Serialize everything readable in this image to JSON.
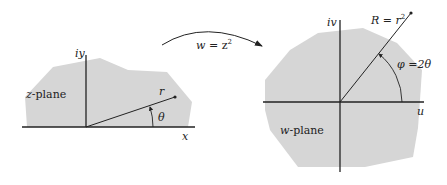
{
  "mapping": {
    "label": "w = z²",
    "label_w": "w",
    "label_eq": " = z",
    "label_exp": "2"
  },
  "z_plane": {
    "name": "z-plane",
    "name_var": "z",
    "name_rest": "-plane",
    "x_axis_label": "x",
    "y_axis_label": "iy",
    "radius_label": "r",
    "angle_label": "θ"
  },
  "w_plane": {
    "name": "w-plane",
    "name_var": "w",
    "name_rest": "-plane",
    "u_axis_label": "u",
    "v_axis_label": "iv",
    "radius_label": "R = r",
    "radius_exp": "2",
    "angle_label": "φ =2θ"
  },
  "colors": {
    "region_fill": "#d6d6d6",
    "line": "#222222"
  }
}
